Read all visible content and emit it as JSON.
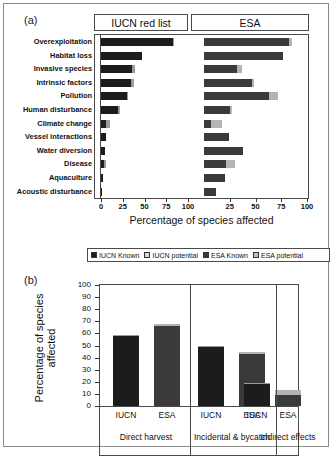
{
  "figure": {
    "panel_a_letter": "(a)",
    "panel_b_letter": "(b)"
  },
  "panel_a": {
    "header_left": "IUCN red list",
    "header_right": "ESA",
    "xlabel": "Percentage of species affected",
    "xticks": [
      "0",
      "25",
      "50",
      "75",
      "100",
      "25",
      "50",
      "75",
      "100"
    ],
    "xticks_left": [
      "0",
      "25",
      "50",
      "75",
      "100"
    ],
    "xticks_right": [
      "25",
      "50",
      "75",
      "100"
    ],
    "categories": [
      "Overexploitation",
      "Habitat loss",
      "Invasive species",
      "Intrinsic factors",
      "Pollution",
      "Human disturbance",
      "Climate change",
      "Vessel interactions",
      "Water diversion",
      "Disease",
      "Aquaculture",
      "Acoustic disturbance"
    ]
  },
  "panel_b": {
    "ylabel": "Percentage of species affected",
    "yticks": [
      "100",
      "90",
      "80",
      "70",
      "60",
      "50",
      "40",
      "30",
      "20",
      "10",
      "0"
    ],
    "group_labels": [
      "Direct harvest",
      "Incidental & bycatch",
      "Indirect effects"
    ],
    "bar_labels": [
      "IUCN",
      "ESA",
      "IUCN",
      "ESA",
      "IUCN",
      "ESA"
    ]
  },
  "legend": {
    "items": [
      {
        "label": "IUCN Known",
        "color": "#1c1c1c"
      },
      {
        "label": "IUCN potential",
        "color": "#d8d8d8"
      },
      {
        "label": "ESA Known",
        "color": "#3a3a3a"
      },
      {
        "label": "ESA potential",
        "color": "#c0c0c0"
      }
    ]
  },
  "colors": {
    "iucn_known": "#1c1c1c",
    "iucn_potential": "#9a9a9a",
    "esa_known": "#3a3a3a",
    "esa_potential": "#b4b4b4",
    "axis": "#4a4a4a",
    "border": "#8a8a8a"
  },
  "chart_data": [
    {
      "type": "bar",
      "id": "panel-a",
      "orientation": "horizontal",
      "title": "",
      "xlabel": "Percentage of species affected",
      "ylabel": "",
      "xlim": [
        0,
        100
      ],
      "grid": false,
      "legend_position": "below-figure",
      "categories": [
        "Overexploitation",
        "Habitat loss",
        "Invasive species",
        "Intrinsic factors",
        "Pollution",
        "Human disturbance",
        "Climate change",
        "Vessel interactions",
        "Water diversion",
        "Disease",
        "Aquaculture",
        "Acoustic disturbance"
      ],
      "series": [
        {
          "name": "IUCN Known",
          "panel": "IUCN red list",
          "stack": "iucn",
          "values": [
            83,
            47,
            36,
            35,
            30,
            20,
            6,
            6,
            4.5,
            3,
            2,
            0.5
          ]
        },
        {
          "name": "IUCN potential",
          "panel": "IUCN red list",
          "stack": "iucn",
          "values": [
            1,
            0,
            3,
            3,
            1,
            2,
            4,
            0,
            0,
            3,
            0,
            0
          ]
        },
        {
          "name": "ESA Known",
          "panel": "ESA",
          "stack": "esa",
          "values": [
            83,
            77,
            32,
            47,
            63,
            25,
            7,
            24,
            38,
            21,
            20,
            12
          ]
        },
        {
          "name": "ESA potential",
          "panel": "ESA",
          "stack": "esa",
          "values": [
            2,
            0,
            5,
            2,
            9,
            2,
            10,
            0,
            0,
            9,
            0,
            0
          ]
        }
      ]
    },
    {
      "type": "bar",
      "id": "panel-b",
      "orientation": "vertical",
      "title": "",
      "xlabel": "",
      "ylabel": "Percentage of species affected",
      "ylim": [
        0,
        100
      ],
      "grid": false,
      "categories": [
        "IUCN",
        "ESA",
        "IUCN",
        "ESA",
        "IUCN",
        "ESA"
      ],
      "groups": [
        "Direct harvest",
        "Direct harvest",
        "Incidental & bycatch",
        "Incidental & bycatch",
        "Indirect effects",
        "Indirect effects"
      ],
      "series": [
        {
          "name": "Known",
          "values": [
            58,
            66,
            49,
            43,
            18,
            9
          ]
        },
        {
          "name": "potential",
          "values": [
            1,
            2,
            1,
            2,
            1,
            4
          ]
        }
      ]
    }
  ]
}
